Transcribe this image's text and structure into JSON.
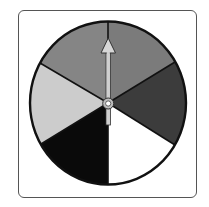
{
  "spinner": {
    "segment_count": 6,
    "segments": [
      {
        "name": "top-right",
        "color": "#7b7b7b"
      },
      {
        "name": "right",
        "color": "#3c3c3c"
      },
      {
        "name": "bottom-right",
        "color": "#ffffff"
      },
      {
        "name": "bottom-left",
        "color": "#0a0a0a"
      },
      {
        "name": "left",
        "color": "#cccccc"
      },
      {
        "name": "top-left",
        "color": "#858585"
      }
    ],
    "pointer_direction": "up",
    "pointer_color": "#c8c8c8",
    "outline_color": "#111111",
    "frame_color": "#555555"
  }
}
